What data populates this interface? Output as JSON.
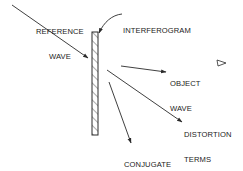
{
  "diagram": {
    "type": "holographic interferogram reconstruction",
    "stroke_color": "#2a2a2a",
    "background": "#ffffff",
    "plate": {
      "name": "interferogram",
      "hatched": true
    },
    "labels": {
      "reference_wave": {
        "line1": "REFERENCE",
        "line2": "WAVE"
      },
      "interferogram": {
        "line1": "INTERFEROGRAM"
      },
      "object_wave": {
        "line1": "OBJECT",
        "line2": "WAVE"
      },
      "distortion_terms": {
        "line1": "DISTORTION",
        "line2": "TERMS"
      },
      "conjugate_wave": {
        "line1": "CONJUGATE",
        "line2": "WAVE"
      }
    },
    "arrows": [
      {
        "name": "reference-wave",
        "direction": "into plate"
      },
      {
        "name": "object-wave",
        "direction": "away from plate"
      },
      {
        "name": "distortion-terms",
        "direction": "away from plate"
      },
      {
        "name": "conjugate-wave",
        "direction": "away from plate"
      }
    ],
    "marker": {
      "name": "eye-observer-marker",
      "shape": "triangle"
    }
  }
}
